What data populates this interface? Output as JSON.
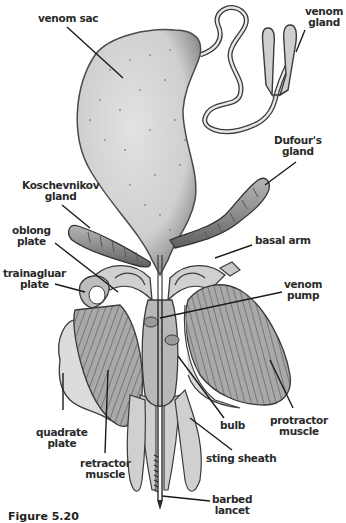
{
  "diagram": {
    "colors": {
      "outline": "#3a3a3a",
      "fill_light": "#d6d6d6",
      "fill_mid": "#a8a8a8",
      "fill_dark": "#7a7a7a",
      "leader": "#1a1a1a",
      "background": "#ffffff"
    },
    "labels": {
      "venom_sac": "venom sac",
      "venom_gland_1": "venom",
      "venom_gland_2": "gland",
      "dufours_gland_1": "Dufour's",
      "dufours_gland_2": "gland",
      "koschevnikov_1": "Koschevnikov",
      "koschevnikov_2": "gland",
      "oblong_1": "oblong",
      "oblong_2": "plate",
      "basal_arm": "basal arm",
      "triangular_1": "trainagluar",
      "triangular_2": "plate",
      "venom_pump_1": "venom",
      "venom_pump_2": "pump",
      "quadrate_1": "quadrate",
      "quadrate_2": "plate",
      "bulb": "bulb",
      "protractor_1": "protractor",
      "protractor_2": "muscle",
      "retractor_1": "retractor",
      "retractor_2": "muscle",
      "sting_sheath": "sting sheath",
      "barbed_1": "barbed",
      "barbed_2": "lancet"
    },
    "caption": "Figure 5.20"
  }
}
